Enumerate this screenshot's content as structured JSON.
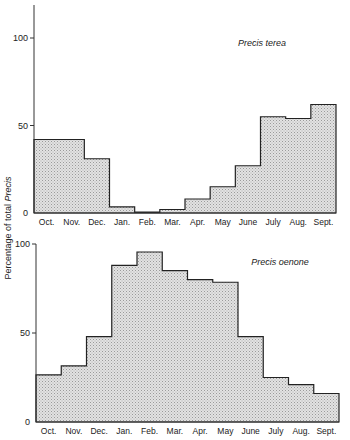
{
  "figure": {
    "ylabel_prefix": "Percentage of total ",
    "ylabel_italic": "Precis"
  },
  "chart_data": [
    {
      "type": "bar",
      "style": "step-histogram",
      "title": "Precis terea",
      "categories": [
        "Oct.",
        "Nov.",
        "Dec.",
        "Jan.",
        "Feb.",
        "Mar.",
        "Apr.",
        "May",
        "June",
        "July",
        "Aug.",
        "Sept."
      ],
      "values": [
        42,
        42,
        31,
        3.5,
        0.5,
        2,
        8,
        15,
        27,
        55,
        54,
        62
      ],
      "xlabel": "",
      "ylabel": "Percentage of total Precis",
      "yticks": [
        0,
        50,
        100
      ],
      "ylim": [
        0,
        110
      ],
      "grid": false,
      "legend": "none"
    },
    {
      "type": "bar",
      "style": "step-histogram",
      "title": "Precis oenone",
      "categories": [
        "Oct.",
        "Nov.",
        "Dec.",
        "Jan.",
        "Feb.",
        "Mar.",
        "Apr.",
        "May",
        "June",
        "July",
        "Aug.",
        "Sept."
      ],
      "values": [
        26.5,
        31.5,
        48,
        88,
        95.5,
        85,
        80,
        78.5,
        48,
        25,
        21,
        16
      ],
      "xlabel": "",
      "ylabel": "Percentage of total Precis",
      "yticks": [
        0,
        50,
        100
      ],
      "ylim": [
        0,
        100
      ],
      "grid": false,
      "legend": "none"
    }
  ]
}
